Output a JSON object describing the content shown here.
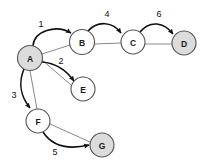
{
  "diagram": {
    "background_color": "#ffffff",
    "node_fill_plain": "#ffffff",
    "node_fill_visited": "#dcdcdc",
    "node_stroke_color": "#555555",
    "edge_color_thin": "#888888",
    "edge_color_bold": "#111111",
    "nodes": [
      {
        "id": "A",
        "label": "A",
        "cx": 30,
        "cy": 58,
        "r": 12.5,
        "state": "visited"
      },
      {
        "id": "B",
        "label": "B",
        "cx": 82,
        "cy": 42,
        "r": 12.5,
        "state": "plain"
      },
      {
        "id": "C",
        "label": "C",
        "cx": 133,
        "cy": 42,
        "r": 12.0,
        "state": "plain"
      },
      {
        "id": "D",
        "label": "D",
        "cx": 184,
        "cy": 43,
        "r": 12.0,
        "state": "visited"
      },
      {
        "id": "E",
        "label": "E",
        "cx": 83,
        "cy": 89,
        "r": 12.0,
        "state": "plain"
      },
      {
        "id": "F",
        "label": "F",
        "cx": 38,
        "cy": 121,
        "r": 12.0,
        "state": "plain"
      },
      {
        "id": "G",
        "label": "G",
        "cx": 102,
        "cy": 145,
        "r": 12.0,
        "state": "visited"
      }
    ],
    "traversal_edges": [
      {
        "from": "A",
        "to": "B",
        "weight": "1",
        "label_x": 41,
        "label_y": 24,
        "path": "M 33 46 C 34 31 56 24 71 33",
        "arrow_at": [
          71,
          33
        ],
        "arrow_angle": 32
      },
      {
        "from": "A",
        "to": "E",
        "weight": "2",
        "label_x": 61,
        "label_y": 61,
        "path": "M 42 62 C 55 63 66 70 74 81",
        "arrow_at": [
          74,
          81
        ],
        "arrow_angle": 54
      },
      {
        "from": "A",
        "to": "F",
        "weight": "3",
        "label_x": 14,
        "label_y": 95,
        "path": "M 24 69 C 18 83 21 97 30 108",
        "arrow_at": [
          30,
          108
        ],
        "arrow_angle": 52
      },
      {
        "from": "B",
        "to": "C",
        "weight": "4",
        "label_x": 107,
        "label_y": 14,
        "path": "M 88 31 C 98 20 113 22 121 33",
        "arrow_at": [
          121,
          33
        ],
        "arrow_angle": 53
      },
      {
        "from": "F",
        "to": "G",
        "weight": "5",
        "label_x": 55,
        "label_y": 152,
        "path": "M 43 132 C 54 149 72 149 89 145",
        "arrow_at": [
          89,
          145
        ],
        "arrow_angle": -12
      },
      {
        "from": "C",
        "to": "D",
        "weight": "6",
        "label_x": 159,
        "label_y": 14,
        "path": "M 140 32 C 150 20 164 22 173 34",
        "arrow_at": [
          173,
          34
        ],
        "arrow_angle": 53
      }
    ],
    "plain_edges": [
      {
        "from": "A",
        "to": "B",
        "path": "M 42 54 L 70 45"
      },
      {
        "from": "A",
        "to": "E",
        "path": "M 42 60 L 71 85"
      },
      {
        "from": "A",
        "to": "F",
        "path": "M 30 71 L 37 109"
      },
      {
        "from": "B",
        "to": "C",
        "path": "M 94 44 L 121 43"
      },
      {
        "from": "C",
        "to": "D",
        "path": "M 145 44 L 172 44"
      },
      {
        "from": "F",
        "to": "G",
        "path": "M 50 124 L 90 142"
      }
    ]
  }
}
